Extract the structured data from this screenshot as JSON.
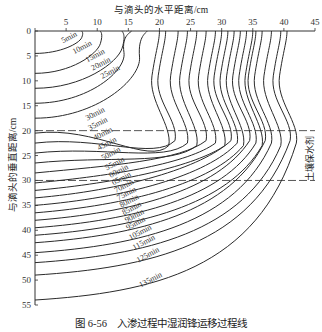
{
  "chart_data": {
    "type": "line",
    "title": "",
    "caption": "图 6-56　入渗过程中湿润锋运移过程线",
    "xlabel": "与滴头的水平距离/cm",
    "ylabel": "与滴头的垂直距离/cm",
    "x_ticks": [
      0,
      5,
      10,
      15,
      20,
      25,
      30,
      35,
      40,
      45
    ],
    "y_ticks": [
      0,
      5,
      10,
      15,
      20,
      25,
      30,
      35,
      40,
      45,
      50,
      55
    ],
    "xlim": [
      0,
      45
    ],
    "ylim": [
      0,
      55
    ],
    "y_inverted": true,
    "x_axis_position": "top",
    "grid": false,
    "annotations": [
      {
        "type": "dashed-hline",
        "y": 20
      },
      {
        "type": "dashed-hline",
        "y": 30
      },
      {
        "type": "text",
        "text": "土壤保水剂",
        "x": 44,
        "y": 25,
        "orientation": "vertical"
      }
    ],
    "series": [
      {
        "name": "5min",
        "x_at_top": 7.5,
        "y_at_axis": 4.5
      },
      {
        "name": "10min",
        "x_at_top": 10.5,
        "y_at_axis": 8.5
      },
      {
        "name": "15min",
        "x_at_top": 14,
        "y_at_axis": 11.5
      },
      {
        "name": "20min",
        "x_at_top": 15.5,
        "y_at_axis": 14.5
      },
      {
        "name": "25min",
        "x_at_top": 18,
        "y_at_axis": 17.5
      },
      {
        "name": "30min",
        "x_at_top": 20,
        "y_at_axis": 20.5
      },
      {
        "name": "35min",
        "x_at_top": 21,
        "y_at_axis": 22.5
      },
      {
        "name": "40min",
        "x_at_top": 23,
        "y_at_axis": 24.5
      },
      {
        "name": "45min",
        "x_at_top": 24.5,
        "y_at_axis": 26.5
      },
      {
        "name": "50min",
        "x_at_top": 26,
        "y_at_axis": 28.5
      },
      {
        "name": "55min",
        "x_at_top": 27.5,
        "y_at_axis": 30.5
      },
      {
        "name": "60min",
        "x_at_top": 29,
        "y_at_axis": 32
      },
      {
        "name": "65min",
        "x_at_top": 30,
        "y_at_axis": 33.5
      },
      {
        "name": "70min",
        "x_at_top": 31,
        "y_at_axis": 35
      },
      {
        "name": "75min",
        "x_at_top": 32,
        "y_at_axis": 36.5
      },
      {
        "name": "80min",
        "x_at_top": 33,
        "y_at_axis": 38
      },
      {
        "name": "85min",
        "x_at_top": 34,
        "y_at_axis": 39.5
      },
      {
        "name": "90min",
        "x_at_top": 35,
        "y_at_axis": 41
      },
      {
        "name": "95min",
        "x_at_top": 35.5,
        "y_at_axis": 42.5
      },
      {
        "name": "105min",
        "x_at_top": 36.5,
        "y_at_axis": 44.5
      },
      {
        "name": "115min",
        "x_at_top": 38,
        "y_at_axis": 46.5
      },
      {
        "name": "125min",
        "x_at_top": 39.5,
        "y_at_axis": 49
      },
      {
        "name": "135min",
        "x_at_top": 40.5,
        "y_at_axis": 54
      }
    ]
  },
  "labels": {
    "xtitle": "与滴头的水平距离/cm",
    "ytitle": "与滴头的垂直距离/cm",
    "side": "土壤保水剂",
    "caption": "图 6-56　入渗过程中湿润锋运移过程线"
  }
}
